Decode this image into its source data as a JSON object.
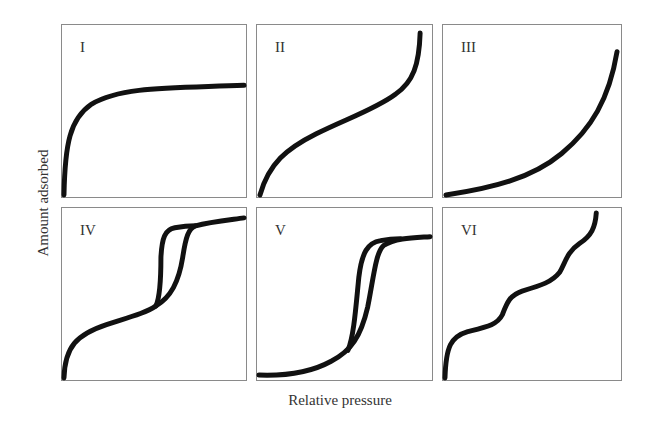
{
  "figure": {
    "y_axis_label": "Amount adsorbed",
    "x_axis_label": "Relative pressure",
    "panels": [
      {
        "id": "I",
        "label": "I",
        "description": "Type I isotherm: steep rise at low pressure then plateau"
      },
      {
        "id": "II",
        "label": "II",
        "description": "Type II isotherm: concave then linear then convex rise"
      },
      {
        "id": "III",
        "label": "III",
        "description": "Type III isotherm: convex throughout, rising steeply near end"
      },
      {
        "id": "IV",
        "label": "IV",
        "description": "Type IV isotherm: like II with hysteresis loop and plateau"
      },
      {
        "id": "V",
        "label": "V",
        "description": "Type V isotherm: like III with hysteresis loop and plateau"
      },
      {
        "id": "VI",
        "label": "VI",
        "description": "Type VI isotherm: stepwise multilayer adsorption"
      }
    ]
  },
  "colors": {
    "curve": "#111111",
    "frame": "#8a8a8a",
    "text": "#333333"
  }
}
